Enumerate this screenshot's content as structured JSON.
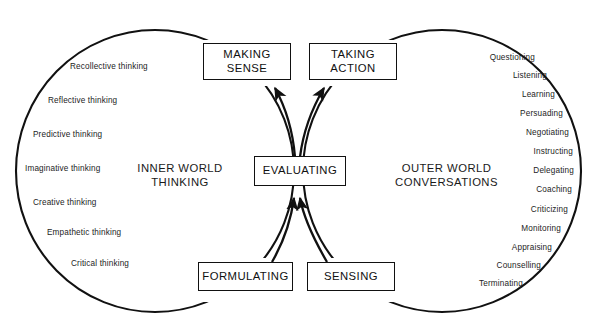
{
  "diagram": {
    "zones": {
      "left": {
        "line1": "INNER WORLD",
        "line2": "THINKING"
      },
      "right": {
        "line1": "OUTER WORLD",
        "line2": "CONVERSATIONS"
      }
    },
    "boxes": [
      {
        "id": "making-sense",
        "line1": "MAKING",
        "line2": "SENSE"
      },
      {
        "id": "taking-action",
        "line1": "TAKING",
        "line2": "ACTION"
      },
      {
        "id": "evaluating",
        "line1": "EVALUATING",
        "line2": ""
      },
      {
        "id": "formulating",
        "line1": "FORMULATING",
        "line2": ""
      },
      {
        "id": "sensing",
        "line1": "SENSING",
        "line2": ""
      }
    ],
    "left_labels": [
      {
        "text": "Recollective thinking",
        "x": 70,
        "y": 66
      },
      {
        "text": "Reflective thinking",
        "x": 48,
        "y": 100
      },
      {
        "text": "Predictive thinking",
        "x": 33,
        "y": 134
      },
      {
        "text": "Imaginative thinking",
        "x": 25,
        "y": 168
      },
      {
        "text": "Creative thinking",
        "x": 33,
        "y": 202
      },
      {
        "text": "Empathetic thinking",
        "x": 47,
        "y": 232
      },
      {
        "text": "Critical thinking",
        "x": 71,
        "y": 263
      }
    ],
    "right_labels": [
      {
        "text": "Questioning",
        "x": 465,
        "y": 57
      },
      {
        "text": "Listening",
        "x": 502,
        "y": 75
      },
      {
        "text": "Learning",
        "x": 517,
        "y": 94
      },
      {
        "text": "Persuading",
        "x": 524,
        "y": 113
      },
      {
        "text": "Negotiating",
        "x": 528,
        "y": 132
      },
      {
        "text": "Instructing",
        "x": 533,
        "y": 151
      },
      {
        "text": "Delegating",
        "x": 533,
        "y": 170
      },
      {
        "text": "Coaching",
        "x": 531,
        "y": 189
      },
      {
        "text": "Criticizing",
        "x": 527,
        "y": 209
      },
      {
        "text": "Monitoring",
        "x": 520,
        "y": 228
      },
      {
        "text": "Appraising",
        "x": 510,
        "y": 247
      },
      {
        "text": "Counselling",
        "x": 494,
        "y": 265
      },
      {
        "text": "Terminating",
        "x": 461,
        "y": 283
      }
    ],
    "colors": {
      "stroke": "#111111",
      "text": "#1a1a1a",
      "background": "#ffffff"
    },
    "flow": [
      {
        "from": "evaluating",
        "to": "making-sense"
      },
      {
        "from": "evaluating",
        "to": "taking-action"
      },
      {
        "from": "formulating",
        "to": "evaluating"
      },
      {
        "from": "sensing",
        "to": "evaluating"
      }
    ]
  }
}
